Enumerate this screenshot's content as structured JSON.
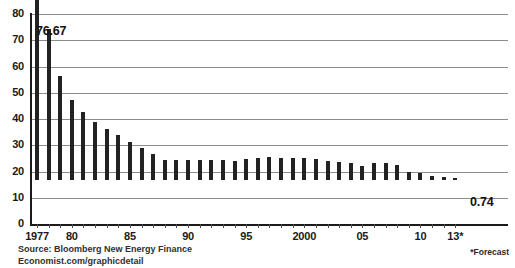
{
  "chart_data": {
    "type": "bar",
    "title": "",
    "subtitle": "",
    "xlabel": "",
    "ylabel": "",
    "ylim": [
      0,
      80
    ],
    "yticks": [
      0,
      10,
      20,
      30,
      40,
      50,
      60,
      70,
      80
    ],
    "grid": true,
    "legend": null,
    "categories": [
      "1977",
      "1978",
      "1979",
      "1980",
      "1981",
      "1982",
      "1983",
      "1984",
      "1985",
      "1986",
      "1987",
      "1988",
      "1989",
      "1990",
      "1991",
      "1992",
      "1993",
      "1994",
      "1995",
      "1996",
      "1997",
      "1998",
      "1999",
      "2000",
      "2001",
      "2002",
      "2003",
      "2004",
      "2005",
      "2006",
      "2007",
      "2008",
      "2009",
      "2010",
      "2011",
      "2012",
      "2013"
    ],
    "values": [
      76.67,
      57.5,
      39.8,
      30.5,
      26.0,
      22.2,
      19.5,
      17.2,
      14.6,
      12.2,
      10.0,
      7.6,
      7.5,
      7.7,
      7.6,
      7.6,
      7.5,
      7.4,
      7.9,
      8.5,
      8.7,
      8.5,
      8.3,
      8.4,
      8.0,
      7.3,
      6.8,
      6.5,
      5.5,
      6.3,
      6.3,
      5.7,
      3.2,
      2.6,
      1.6,
      1.0,
      0.74
    ],
    "tick_label_indices": [
      0,
      3,
      8,
      13,
      18,
      23,
      28,
      33,
      36
    ],
    "tick_labels": [
      "1977",
      "80",
      "85",
      "90",
      "95",
      "2000",
      "05",
      "10",
      "13*"
    ],
    "annotations": [
      {
        "id": "first-value",
        "text": "76.67",
        "category": "1977",
        "value": 76.67
      },
      {
        "id": "last-value",
        "text": "0.74",
        "category": "2013",
        "value": 0.74
      }
    ],
    "footnote": "*Forecast",
    "source": [
      "Source: Bloomberg New Energy Finance",
      "Economist.com/graphicdetail"
    ],
    "colors": {
      "bar": "#222222",
      "gridline": "#8c8c8c",
      "axis": "#1a1a1a",
      "text": "#1a1a1a",
      "background": "#ffffff"
    }
  }
}
